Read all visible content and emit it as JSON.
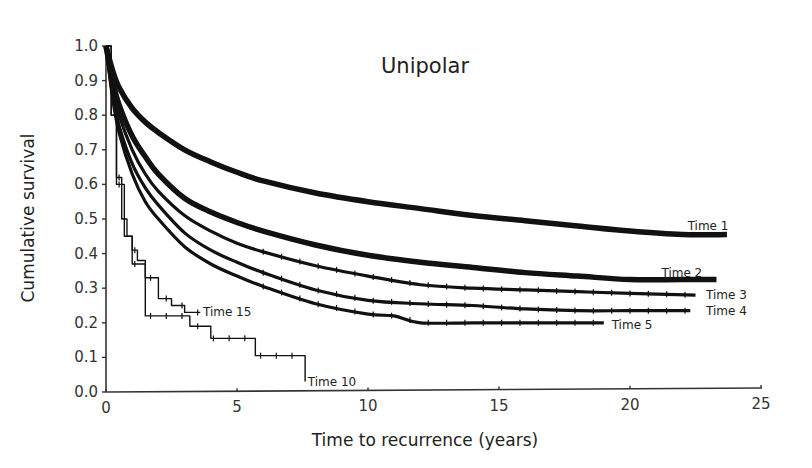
{
  "chart_data": {
    "type": "line",
    "subtype": "kaplan-meier survival curves",
    "title": "Unipolar",
    "xlabel": "Time to recurrence (years)",
    "ylabel": "Cumulative survival",
    "xlim": [
      0,
      25
    ],
    "ylim": [
      0.0,
      1.0
    ],
    "xticks": [
      0,
      5,
      10,
      15,
      20,
      25
    ],
    "yticks": [
      0.0,
      0.1,
      0.2,
      0.3,
      0.4,
      0.5,
      0.6,
      0.7,
      0.8,
      0.9,
      1.0
    ],
    "ytick_labels": [
      "0.0",
      "0.1",
      "0.2",
      "0.3",
      "0.4",
      "0.5",
      "0.6",
      "0.7",
      "0.8",
      "0.9",
      "1.0"
    ],
    "xtick_labels": [
      "0",
      "5",
      "10",
      "15",
      "20",
      "25"
    ],
    "grid": false,
    "legend": "inline labels at curve ends",
    "series": [
      {
        "name": "Time 1",
        "style": "thick",
        "x": [
          0,
          0.25,
          0.5,
          1,
          1.5,
          2,
          3,
          4,
          5,
          6,
          8,
          10,
          12,
          14,
          16,
          18,
          20,
          22,
          23.7
        ],
        "y": [
          1.0,
          0.93,
          0.88,
          0.82,
          0.78,
          0.75,
          0.7,
          0.665,
          0.635,
          0.61,
          0.575,
          0.55,
          0.53,
          0.51,
          0.495,
          0.48,
          0.465,
          0.455,
          0.455
        ]
      },
      {
        "name": "Time 2",
        "style": "thick",
        "x": [
          0,
          0.25,
          0.5,
          1,
          1.5,
          2,
          3,
          4,
          5,
          6,
          8,
          10,
          12,
          14,
          16,
          18,
          20,
          22,
          23.3
        ],
        "y": [
          1.0,
          0.9,
          0.83,
          0.74,
          0.68,
          0.63,
          0.56,
          0.52,
          0.49,
          0.465,
          0.425,
          0.395,
          0.375,
          0.36,
          0.345,
          0.335,
          0.325,
          0.325,
          0.325
        ]
      },
      {
        "name": "Time 3",
        "style": "censored",
        "x": [
          0,
          0.25,
          0.5,
          1,
          1.5,
          2,
          3,
          4,
          5,
          6,
          8,
          10,
          12,
          14,
          16,
          18,
          20,
          22.5
        ],
        "y": [
          1.0,
          0.88,
          0.8,
          0.7,
          0.63,
          0.58,
          0.51,
          0.465,
          0.43,
          0.405,
          0.365,
          0.335,
          0.31,
          0.3,
          0.295,
          0.29,
          0.285,
          0.28
        ]
      },
      {
        "name": "Time 4",
        "style": "censored",
        "x": [
          0,
          0.25,
          0.5,
          1,
          1.5,
          2,
          3,
          4,
          5,
          6,
          8,
          10,
          12,
          14,
          16,
          18,
          20,
          22.3
        ],
        "y": [
          1.0,
          0.86,
          0.77,
          0.66,
          0.59,
          0.54,
          0.46,
          0.41,
          0.375,
          0.345,
          0.295,
          0.265,
          0.255,
          0.25,
          0.24,
          0.235,
          0.235,
          0.235
        ]
      },
      {
        "name": "Time 5",
        "style": "censored",
        "x": [
          0,
          0.25,
          0.5,
          1,
          1.5,
          2,
          3,
          4,
          5,
          6,
          8,
          10,
          11,
          12,
          14,
          16,
          19
        ],
        "y": [
          1.0,
          0.85,
          0.75,
          0.63,
          0.55,
          0.5,
          0.42,
          0.37,
          0.335,
          0.305,
          0.255,
          0.225,
          0.22,
          0.2,
          0.2,
          0.2,
          0.2
        ]
      },
      {
        "name": "Time 15",
        "style": "step",
        "x": [
          0,
          0.2,
          0.4,
          0.6,
          0.8,
          1.0,
          1.2,
          1.5,
          2.0,
          2.5,
          3.0,
          3.6
        ],
        "y": [
          1.0,
          0.8,
          0.62,
          0.5,
          0.45,
          0.41,
          0.38,
          0.33,
          0.27,
          0.25,
          0.23,
          0.23
        ]
      },
      {
        "name": "Time 10",
        "style": "step",
        "x": [
          0,
          0.2,
          0.4,
          0.7,
          1.0,
          1.5,
          2.5,
          3.2,
          4.0,
          5.7,
          7.6,
          7.6
        ],
        "y": [
          1.0,
          0.8,
          0.6,
          0.45,
          0.37,
          0.22,
          0.22,
          0.19,
          0.155,
          0.105,
          0.105,
          0.03
        ]
      }
    ],
    "annotations": [
      {
        "text": "Time 1",
        "x": 22.2,
        "y": 0.48
      },
      {
        "text": "Time 2",
        "x": 21.2,
        "y": 0.345
      },
      {
        "text": "Time 3",
        "x": 22.9,
        "y": 0.28
      },
      {
        "text": "Time 4",
        "x": 22.9,
        "y": 0.235
      },
      {
        "text": "Time 5",
        "x": 19.3,
        "y": 0.195
      },
      {
        "text": "Time 15",
        "x": 3.7,
        "y": 0.23
      },
      {
        "text": "Time 10",
        "x": 7.7,
        "y": 0.03
      }
    ]
  }
}
